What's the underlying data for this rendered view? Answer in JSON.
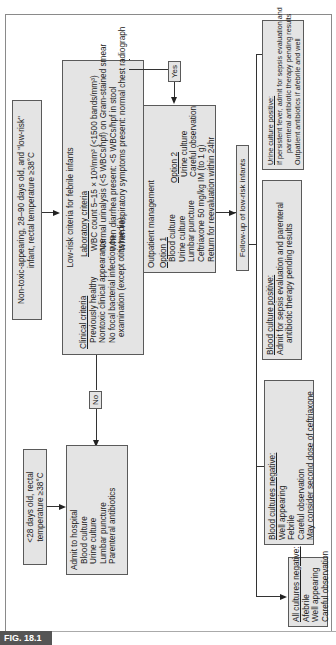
{
  "figure": {
    "label": "FIG. 18.1"
  },
  "nodes": {
    "low_risk_entry": {
      "lines": [
        "Non-toxic-appearing, 28–90 days old, and \"low-risk\"",
        "infant, rectal temperature ≥38°C"
      ]
    },
    "neonate_entry": {
      "lines": [
        "<28 days old, rectal",
        "temperature ≥38°C"
      ]
    },
    "criteria": {
      "title": "Low-risk criteria for febrile infants",
      "clinical_heading": "Clinical criteria",
      "clinical": [
        "Previously healthy",
        "Nontoxic clinical appearance",
        "No focal bacterial infection on",
        "examination (except otitis media)"
      ],
      "laboratory_heading": "Laboratory criteria",
      "laboratory": [
        "WBC count 5–15 × 10³/mm³ (<1500 bands/mm³)",
        "Normal urinalysis (<5 WBCs/hpf) on Gram-stained smear",
        "When diarrhea present: <5 WBCs/hpf in stool",
        "When respiratory symptoms present: normal chest radiograph"
      ]
    },
    "decision_no": {
      "label": "No"
    },
    "decision_yes": {
      "label": "Yes"
    },
    "admit": {
      "lines": [
        "Admit to hospital",
        "Blood culture",
        "Urine culture",
        "Lumbar puncture",
        "Parenteral antibiotics"
      ]
    },
    "outpatient": {
      "title": "Outpatient management",
      "option1_heading": "Option 1",
      "option1": [
        "Blood culture",
        "Urine culture",
        "Lumbar puncture",
        "Ceftriaxone 50 mg/kg IM (to 1 g)",
        "Return for reevaluation within 24hr"
      ],
      "option2_heading": "Option 2",
      "option2": [
        "Urine culture",
        "Careful observation"
      ]
    },
    "followup": {
      "label": "Follow-up of low-risk infants"
    },
    "all_negative": {
      "heading": "All cultures negative:",
      "lines": [
        "Afebrile",
        "Well appearing",
        "Careful observation"
      ]
    },
    "blood_negative": {
      "heading": "Blood cultures negative:",
      "lines": [
        "Well appearing",
        "Febrile",
        "Careful observation",
        "May consider second dose of ceftriaxone"
      ]
    },
    "blood_positive": {
      "heading": "Blood culture positive:",
      "lines": [
        "Admit for sepsis evaluation and parenteral",
        "antibiotic therapy pending results"
      ]
    },
    "urine_positive": {
      "heading": "Urine culture positive:",
      "lines": [
        "If persistent fever, admit for sepsis evaluation and",
        "parenteral antibiotic therapy pending results",
        "Outpatient antibiotics if afebrile and well"
      ]
    }
  }
}
